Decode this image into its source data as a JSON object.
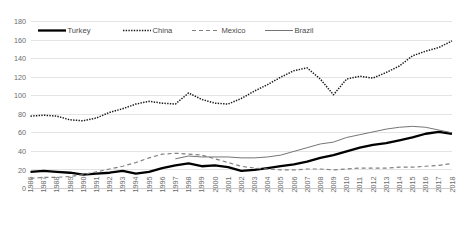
{
  "chart_data": {
    "type": "line",
    "title": "",
    "subtitle": "",
    "xlabel": "",
    "ylabel": "",
    "grid": true,
    "legend_position": "top-left",
    "ylim": [
      0,
      180
    ],
    "yticks": [
      0,
      20,
      40,
      60,
      80,
      100,
      120,
      140,
      160,
      180
    ],
    "x": [
      1986,
      1987,
      1988,
      1989,
      1990,
      1991,
      1992,
      1993,
      1994,
      1995,
      1996,
      1997,
      1998,
      1999,
      2000,
      2001,
      2002,
      2003,
      2004,
      2005,
      2006,
      2007,
      2008,
      2009,
      2010,
      2011,
      2012,
      2013,
      2014,
      2015,
      2016,
      2017,
      2018
    ],
    "categories": [
      "1986",
      "1987",
      "1988",
      "1989",
      "1990",
      "1991",
      "1992",
      "1993",
      "1994",
      "1995",
      "1996",
      "1997",
      "1998",
      "1999",
      "2000",
      "2001",
      "2002",
      "2003",
      "2004",
      "2005",
      "2006",
      "2007",
      "2008",
      "2009",
      "2010",
      "2011",
      "2012",
      "2013",
      "2014",
      "2015",
      "2016",
      "2017",
      "2018"
    ],
    "series": [
      {
        "name": "Turkey",
        "style": "solid-thick",
        "color": "#000000",
        "values": [
          18,
          19,
          18,
          17,
          15,
          16,
          17,
          19,
          16,
          18,
          22,
          25,
          27,
          24,
          25,
          23,
          19,
          20,
          22,
          24,
          26,
          29,
          33,
          36,
          40,
          44,
          47,
          49,
          52,
          55,
          59,
          61,
          59
        ]
      },
      {
        "name": "China",
        "style": "dotted",
        "color": "#1a1a1a",
        "values": [
          78,
          79,
          78,
          74,
          73,
          76,
          82,
          86,
          91,
          94,
          92,
          91,
          103,
          96,
          92,
          91,
          97,
          105,
          112,
          120,
          127,
          130,
          118,
          101,
          118,
          121,
          119,
          125,
          132,
          143,
          148,
          152,
          159
        ]
      },
      {
        "name": "Mexico",
        "style": "dashed",
        "color": "#808080",
        "values": [
          11,
          12,
          12,
          13,
          15,
          18,
          21,
          24,
          28,
          33,
          37,
          38,
          37,
          36,
          32,
          28,
          24,
          22,
          21,
          20,
          20,
          21,
          21,
          20,
          21,
          22,
          22,
          22,
          23,
          23,
          24,
          25,
          27
        ]
      },
      {
        "name": "Brazil",
        "style": "solid-thin",
        "color": "#6e6e6e",
        "values": [
          null,
          null,
          null,
          null,
          null,
          null,
          null,
          null,
          null,
          null,
          null,
          32,
          35,
          34,
          34,
          34,
          33,
          33,
          34,
          36,
          40,
          44,
          48,
          50,
          55,
          58,
          61,
          64,
          66,
          67,
          66,
          63,
          60
        ]
      }
    ],
    "legend": [
      {
        "label": "Turkey",
        "style": "solid-thick",
        "color": "#000000"
      },
      {
        "label": "China",
        "style": "dotted",
        "color": "#1a1a1a"
      },
      {
        "label": "Mexico",
        "style": "dashed",
        "color": "#808080"
      },
      {
        "label": "Brazil",
        "style": "solid-thin",
        "color": "#6e6e6e"
      }
    ]
  },
  "colors": {
    "background": "#ffffff",
    "gridline": "#d9d9d9",
    "axis": "#bfbfbf",
    "tick_label": "#6b6b6b",
    "legend_label": "#4a4a4a"
  }
}
